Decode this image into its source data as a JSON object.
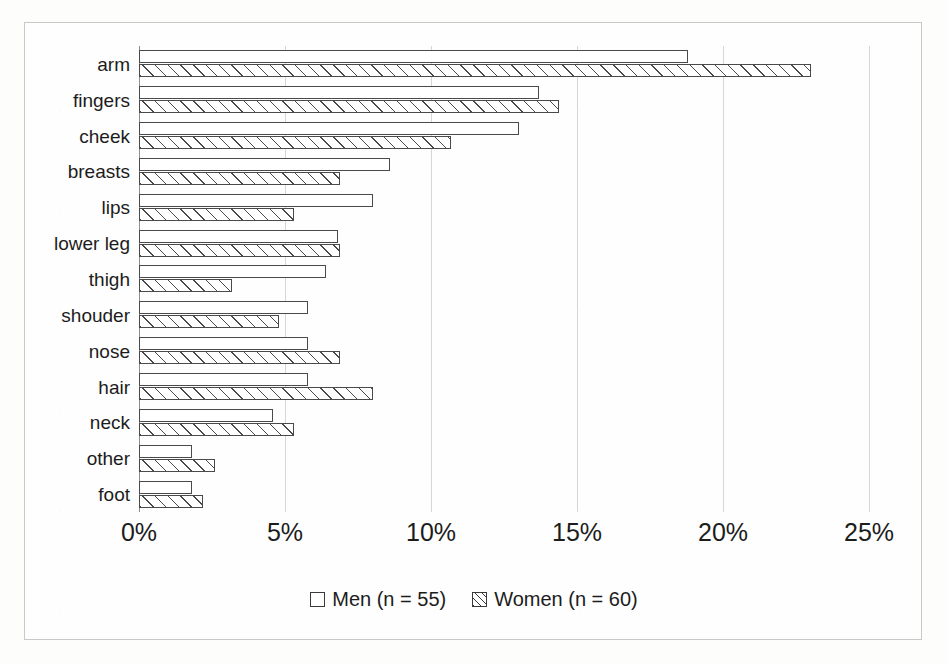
{
  "chart_data": {
    "type": "bar",
    "orientation": "horizontal",
    "title": "",
    "xlabel": "",
    "ylabel": "",
    "xlim": [
      0,
      25
    ],
    "xticks": [
      "0%",
      "5%",
      "10%",
      "15%",
      "20%",
      "25%"
    ],
    "xtick_values": [
      0,
      5,
      10,
      15,
      20,
      25
    ],
    "grid": true,
    "legend_position": "bottom",
    "categories": [
      "arm",
      "fingers",
      "cheek",
      "breasts",
      "lips",
      "lower leg",
      "thigh",
      "shouder",
      "nose",
      "hair",
      "neck",
      "other",
      "foot"
    ],
    "series": [
      {
        "name": "Men (n = 55)",
        "pattern": "open",
        "values": [
          18.8,
          13.7,
          13.0,
          8.6,
          8.0,
          6.8,
          6.4,
          5.8,
          5.8,
          5.8,
          4.6,
          1.8,
          1.8
        ]
      },
      {
        "name": "Women (n = 60)",
        "pattern": "hatched",
        "values": [
          23.0,
          14.4,
          10.7,
          6.9,
          5.3,
          6.9,
          3.2,
          4.8,
          6.9,
          8.0,
          5.3,
          2.6,
          2.2
        ]
      }
    ]
  },
  "legend": {
    "items": [
      {
        "label": "Men (n = 55)",
        "pattern": "open"
      },
      {
        "label": "Women (n = 60)",
        "pattern": "hatched"
      }
    ]
  },
  "colors": {
    "bar_outline": "#4a4a4a",
    "gridline": "#d6d6d6",
    "axis": "#8d8d8d",
    "frame": "#c9c9c9",
    "background": "#fefefe",
    "text": "#1c1c1c"
  }
}
